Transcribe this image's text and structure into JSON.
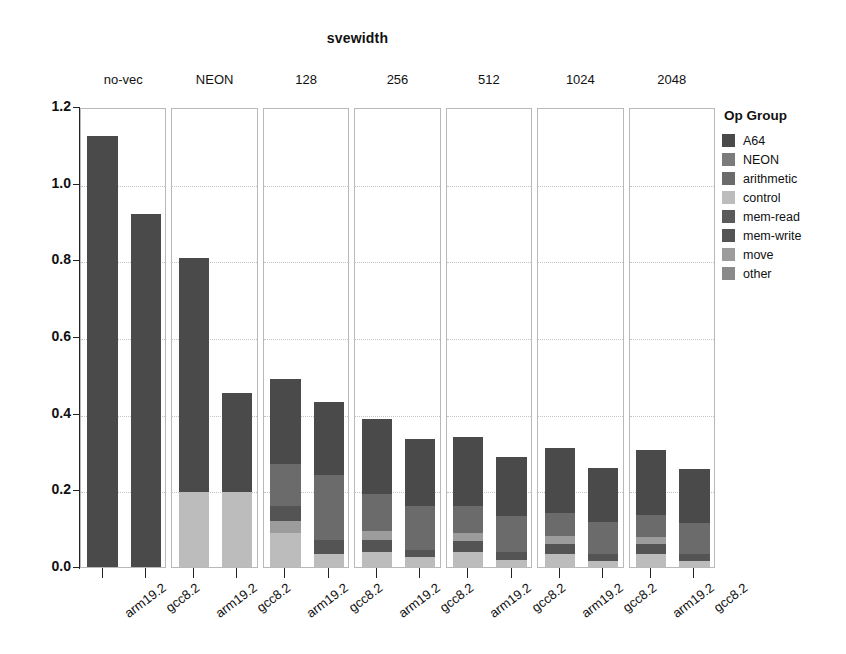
{
  "chart_data": {
    "type": "bar",
    "subtype": "stacked-bar-faceted",
    "title": "svewidth",
    "xlabel": "",
    "ylabel": "Dynamic execution count (billion instructions)",
    "ylim": [
      0.0,
      1.2
    ],
    "yticks": [
      "0.0",
      "0.2",
      "0.4",
      "0.6",
      "0.8",
      "1.0",
      "1.2"
    ],
    "ytick_values": [
      0.0,
      0.2,
      0.4,
      0.6,
      0.8,
      1.0,
      1.2
    ],
    "grid": true,
    "legend_title": "Op Group",
    "legend_position": "right",
    "facet_variable": "svewidth",
    "facets": [
      "no-vec",
      "NEON",
      "128",
      "256",
      "512",
      "1024",
      "2048"
    ],
    "categories": [
      "arm19.2",
      "gcc8.2"
    ],
    "series": [
      {
        "name": "A64",
        "color": "#4a4a4a"
      },
      {
        "name": "NEON",
        "color": "#7b7b7b"
      },
      {
        "name": "arithmetic",
        "color": "#6b6b6b"
      },
      {
        "name": "control",
        "color": "#bcbcbc"
      },
      {
        "name": "mem-read",
        "color": "#5a5a5a"
      },
      {
        "name": "mem-write",
        "color": "#545454"
      },
      {
        "name": "move",
        "color": "#9c9c9c"
      },
      {
        "name": "other",
        "color": "#8a8a8a"
      }
    ],
    "panels": [
      {
        "facet": "no-vec",
        "bars": [
          {
            "category": "arm19.2",
            "total": 1.125,
            "segments": [
              {
                "group": "A64",
                "value": 1.125
              }
            ]
          },
          {
            "category": "gcc8.2",
            "total": 0.92,
            "segments": [
              {
                "group": "A64",
                "value": 0.92
              }
            ]
          }
        ]
      },
      {
        "facet": "NEON",
        "bars": [
          {
            "category": "arm19.2",
            "total": 0.805,
            "segments": [
              {
                "group": "control",
                "value": 0.195
              },
              {
                "group": "A64",
                "value": 0.61
              }
            ]
          },
          {
            "category": "gcc8.2",
            "total": 0.455,
            "segments": [
              {
                "group": "control",
                "value": 0.195
              },
              {
                "group": "A64",
                "value": 0.26
              }
            ]
          }
        ]
      },
      {
        "facet": "128",
        "bars": [
          {
            "category": "arm19.2",
            "total": 0.49,
            "segments": [
              {
                "group": "control",
                "value": 0.09
              },
              {
                "group": "move",
                "value": 0.03
              },
              {
                "group": "mem-write",
                "value": 0.04
              },
              {
                "group": "arithmetic",
                "value": 0.11
              },
              {
                "group": "A64",
                "value": 0.22
              }
            ]
          },
          {
            "category": "gcc8.2",
            "total": 0.43,
            "segments": [
              {
                "group": "control",
                "value": 0.035
              },
              {
                "group": "mem-write",
                "value": 0.035
              },
              {
                "group": "arithmetic",
                "value": 0.17
              },
              {
                "group": "A64",
                "value": 0.19
              }
            ]
          }
        ]
      },
      {
        "facet": "256",
        "bars": [
          {
            "category": "arm19.2",
            "total": 0.385,
            "segments": [
              {
                "group": "control",
                "value": 0.04
              },
              {
                "group": "mem-write",
                "value": 0.03
              },
              {
                "group": "move",
                "value": 0.025
              },
              {
                "group": "arithmetic",
                "value": 0.095
              },
              {
                "group": "A64",
                "value": 0.195
              }
            ]
          },
          {
            "category": "gcc8.2",
            "total": 0.335,
            "segments": [
              {
                "group": "control",
                "value": 0.025
              },
              {
                "group": "mem-write",
                "value": 0.02
              },
              {
                "group": "arithmetic",
                "value": 0.115
              },
              {
                "group": "A64",
                "value": 0.175
              }
            ]
          }
        ]
      },
      {
        "facet": "512",
        "bars": [
          {
            "category": "arm19.2",
            "total": 0.338,
            "segments": [
              {
                "group": "control",
                "value": 0.04
              },
              {
                "group": "mem-write",
                "value": 0.028
              },
              {
                "group": "move",
                "value": 0.022
              },
              {
                "group": "arithmetic",
                "value": 0.068
              },
              {
                "group": "A64",
                "value": 0.18
              }
            ]
          },
          {
            "category": "gcc8.2",
            "total": 0.288,
            "segments": [
              {
                "group": "control",
                "value": 0.018
              },
              {
                "group": "mem-write",
                "value": 0.02
              },
              {
                "group": "arithmetic",
                "value": 0.095
              },
              {
                "group": "A64",
                "value": 0.155
              }
            ]
          }
        ]
      },
      {
        "facet": "1024",
        "bars": [
          {
            "category": "arm19.2",
            "total": 0.31,
            "segments": [
              {
                "group": "control",
                "value": 0.035
              },
              {
                "group": "mem-write",
                "value": 0.025
              },
              {
                "group": "move",
                "value": 0.02
              },
              {
                "group": "arithmetic",
                "value": 0.06
              },
              {
                "group": "A64",
                "value": 0.17
              }
            ]
          },
          {
            "category": "gcc8.2",
            "total": 0.258,
            "segments": [
              {
                "group": "control",
                "value": 0.015
              },
              {
                "group": "mem-write",
                "value": 0.018
              },
              {
                "group": "arithmetic",
                "value": 0.085
              },
              {
                "group": "A64",
                "value": 0.14
              }
            ]
          }
        ]
      },
      {
        "facet": "2048",
        "bars": [
          {
            "category": "arm19.2",
            "total": 0.305,
            "segments": [
              {
                "group": "control",
                "value": 0.035
              },
              {
                "group": "mem-write",
                "value": 0.025
              },
              {
                "group": "move",
                "value": 0.018
              },
              {
                "group": "arithmetic",
                "value": 0.057
              },
              {
                "group": "A64",
                "value": 0.17
              }
            ]
          },
          {
            "category": "gcc8.2",
            "total": 0.255,
            "segments": [
              {
                "group": "control",
                "value": 0.015
              },
              {
                "group": "mem-write",
                "value": 0.018
              },
              {
                "group": "arithmetic",
                "value": 0.082
              },
              {
                "group": "A64",
                "value": 0.14
              }
            ]
          }
        ]
      }
    ]
  }
}
